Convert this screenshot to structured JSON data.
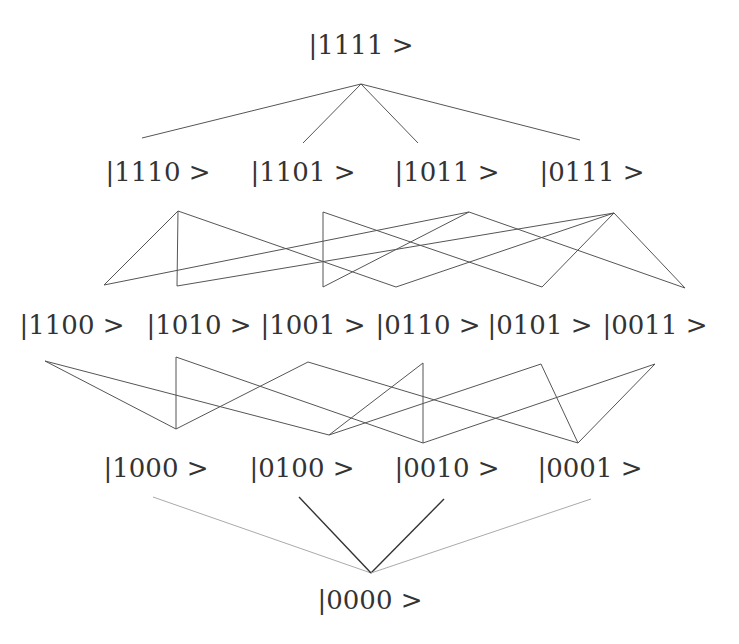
{
  "diagram": {
    "title": "",
    "levels": [
      {
        "name": "level-4",
        "nodes": [
          {
            "label": "|1111 >",
            "x": 361,
            "y": 45
          }
        ]
      },
      {
        "name": "level-3",
        "nodes": [
          {
            "label": "|1110 >",
            "x": 158,
            "y": 172
          },
          {
            "label": "|1101 >",
            "x": 303,
            "y": 172
          },
          {
            "label": "|1011 >",
            "x": 447,
            "y": 172
          },
          {
            "label": "|0111 >",
            "x": 592,
            "y": 172
          }
        ]
      },
      {
        "name": "level-2",
        "nodes": [
          {
            "label": "|1100 >",
            "x": 72,
            "y": 325
          },
          {
            "label": "|1010 >",
            "x": 199,
            "y": 325
          },
          {
            "label": "|1001 >",
            "x": 313,
            "y": 325
          },
          {
            "label": "|0110 >",
            "x": 428,
            "y": 325
          },
          {
            "label": "|0101 >",
            "x": 540,
            "y": 325
          },
          {
            "label": "|0011 >",
            "x": 655,
            "y": 325
          }
        ]
      },
      {
        "name": "level-1",
        "nodes": [
          {
            "label": "|1000 >",
            "x": 156,
            "y": 468
          },
          {
            "label": "|0100 >",
            "x": 302,
            "y": 468
          },
          {
            "label": "|0010 >",
            "x": 447,
            "y": 468
          },
          {
            "label": "|0001 >",
            "x": 590,
            "y": 468
          }
        ]
      },
      {
        "name": "level-0",
        "nodes": [
          {
            "label": "|0000 >",
            "x": 370,
            "y": 600
          }
        ]
      }
    ],
    "edges": [
      {
        "x1": 361,
        "y1": 84,
        "x2": 142,
        "y2": 138,
        "style": "solid"
      },
      {
        "x1": 361,
        "y1": 84,
        "x2": 303,
        "y2": 143,
        "style": "solid"
      },
      {
        "x1": 361,
        "y1": 84,
        "x2": 418,
        "y2": 143,
        "style": "solid"
      },
      {
        "x1": 361,
        "y1": 84,
        "x2": 580,
        "y2": 140,
        "style": "solid"
      },
      {
        "x1": 178,
        "y1": 211,
        "x2": 104,
        "y2": 285,
        "style": "solid"
      },
      {
        "x1": 178,
        "y1": 211,
        "x2": 177,
        "y2": 286,
        "style": "solid"
      },
      {
        "x1": 178,
        "y1": 211,
        "x2": 396,
        "y2": 287,
        "style": "solid"
      },
      {
        "x1": 323,
        "y1": 212,
        "x2": 323,
        "y2": 287,
        "style": "solid"
      },
      {
        "x1": 323,
        "y1": 212,
        "x2": 542,
        "y2": 287,
        "style": "solid"
      },
      {
        "x1": 469,
        "y1": 212,
        "x2": 104,
        "y2": 285,
        "style": "solid"
      },
      {
        "x1": 469,
        "y1": 212,
        "x2": 323,
        "y2": 287,
        "style": "solid"
      },
      {
        "x1": 469,
        "y1": 212,
        "x2": 685,
        "y2": 288,
        "style": "solid"
      },
      {
        "x1": 614,
        "y1": 213,
        "x2": 177,
        "y2": 286,
        "style": "solid"
      },
      {
        "x1": 614,
        "y1": 213,
        "x2": 396,
        "y2": 287,
        "style": "solid"
      },
      {
        "x1": 614,
        "y1": 213,
        "x2": 542,
        "y2": 287,
        "style": "solid"
      },
      {
        "x1": 614,
        "y1": 213,
        "x2": 685,
        "y2": 288,
        "style": "solid"
      },
      {
        "x1": 45,
        "y1": 361,
        "x2": 176,
        "y2": 429,
        "style": "solid"
      },
      {
        "x1": 45,
        "y1": 361,
        "x2": 329,
        "y2": 435,
        "style": "solid"
      },
      {
        "x1": 176,
        "y1": 357,
        "x2": 176,
        "y2": 429,
        "style": "solid"
      },
      {
        "x1": 176,
        "y1": 357,
        "x2": 423,
        "y2": 443,
        "style": "solid"
      },
      {
        "x1": 308,
        "y1": 362,
        "x2": 176,
        "y2": 429,
        "style": "solid"
      },
      {
        "x1": 308,
        "y1": 362,
        "x2": 578,
        "y2": 443,
        "style": "solid"
      },
      {
        "x1": 423,
        "y1": 363,
        "x2": 329,
        "y2": 435,
        "style": "solid"
      },
      {
        "x1": 423,
        "y1": 363,
        "x2": 423,
        "y2": 443,
        "style": "solid"
      },
      {
        "x1": 541,
        "y1": 364,
        "x2": 329,
        "y2": 435,
        "style": "solid"
      },
      {
        "x1": 541,
        "y1": 364,
        "x2": 578,
        "y2": 443,
        "style": "solid"
      },
      {
        "x1": 655,
        "y1": 364,
        "x2": 423,
        "y2": 443,
        "style": "solid"
      },
      {
        "x1": 655,
        "y1": 364,
        "x2": 578,
        "y2": 443,
        "style": "solid"
      },
      {
        "x1": 153,
        "y1": 497,
        "x2": 371,
        "y2": 573,
        "style": "faint"
      },
      {
        "x1": 299,
        "y1": 497,
        "x2": 371,
        "y2": 573,
        "style": "dark"
      },
      {
        "x1": 444,
        "y1": 499,
        "x2": 371,
        "y2": 573,
        "style": "dark"
      },
      {
        "x1": 591,
        "y1": 499,
        "x2": 371,
        "y2": 573,
        "style": "faint"
      }
    ],
    "colors": {
      "line": "#555555",
      "line_faint": "#aaaaaa",
      "line_dark": "#333333",
      "text": "#333333",
      "background": "#ffffff"
    }
  }
}
